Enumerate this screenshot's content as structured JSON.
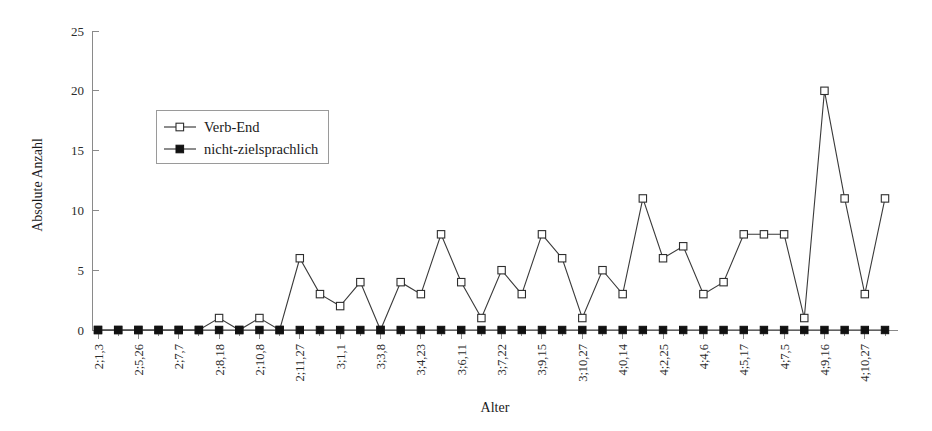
{
  "chart_data": {
    "type": "line",
    "title": "",
    "xlabel": "Alter",
    "ylabel": "Absolute Anzahl",
    "ylim": [
      0,
      25
    ],
    "yticks": [
      0,
      5,
      10,
      15,
      20,
      25
    ],
    "grid": false,
    "legend_position": "upper-left",
    "categories": [
      "2;1,3",
      "2;2,20",
      "2;5,26",
      "2;6,17",
      "2;7,7",
      "2;7,28",
      "2;8,18",
      "2;9,13",
      "2;10,8",
      "2;11,2",
      "2;11,27",
      "3;0,11",
      "3;1,1",
      "3;2,7",
      "3;3,8",
      "3;3,29",
      "3;4,23",
      "3;5,17",
      "3;6,11",
      "3;7,1",
      "3;7,22",
      "3;8,19",
      "3;9,15",
      "3;10,6",
      "3;10,27",
      "3;11,24",
      "4;0,14",
      "4;1,12",
      "4;2,25",
      "4;3,16",
      "4;4,6",
      "4;4,27",
      "4;5,17",
      "4;6,14",
      "4;7,5",
      "4;8,12",
      "4;9,16",
      "4;10,7",
      "4;10,27",
      "4;11,18"
    ],
    "tick_labels": [
      "2;1,3",
      "",
      "2;5,26",
      "",
      "2;7,7",
      "",
      "2;8,18",
      "",
      "2;10,8",
      "",
      "2;11,27",
      "",
      "3;1,1",
      "",
      "3;3,8",
      "",
      "3;4,23",
      "",
      "3;6,11",
      "",
      "3;7,22",
      "",
      "3;9,15",
      "",
      "3;10,27",
      "",
      "4;0,14",
      "",
      "4;2,25",
      "",
      "4;4,6",
      "",
      "4;5,17",
      "",
      "4;7,5",
      "",
      "4;9,16",
      "",
      "4;10,27",
      ""
    ],
    "series": [
      {
        "name": "Verb-End",
        "marker": "open-square",
        "values": [
          0,
          0,
          0,
          0,
          0,
          0,
          1,
          0,
          1,
          0,
          6,
          3,
          2,
          4,
          0,
          4,
          3,
          8,
          4,
          1,
          5,
          3,
          8,
          6,
          1,
          5,
          3,
          11,
          6,
          7,
          3,
          4,
          8,
          8,
          8,
          1,
          20,
          11,
          3,
          11
        ]
      },
      {
        "name": "nicht-zielsprachlich",
        "marker": "filled-square",
        "values": [
          0,
          0,
          0,
          0,
          0,
          0,
          0,
          0,
          0,
          0,
          0,
          0,
          0,
          0,
          0,
          0,
          0,
          0,
          0,
          0,
          0,
          0,
          0,
          0,
          0,
          0,
          0,
          0,
          0,
          0,
          0,
          0,
          0,
          0,
          0,
          0,
          0,
          0,
          0,
          0
        ]
      }
    ]
  },
  "legend": {
    "items": [
      {
        "label": "Verb-End",
        "marker": "open-square"
      },
      {
        "label": "nicht-zielsprachlich",
        "marker": "filled-square"
      }
    ]
  },
  "colors": {
    "line": "#3a3a3a",
    "axis": "#8a8a8a",
    "text": "#1a1a1a",
    "marker_fill_open": "#ffffff",
    "marker_fill_closed": "#111111",
    "background": "#ffffff"
  }
}
